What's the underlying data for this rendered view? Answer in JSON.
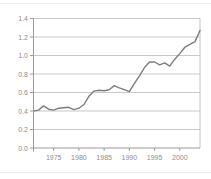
{
  "page": {
    "background": "#ffffff",
    "top_rule_color": "#efefef",
    "bottom_rule_color": "#e9e9e6"
  },
  "chart_data": {
    "type": "line",
    "title": "",
    "xlabel": "",
    "ylabel": "",
    "legend": "none",
    "grid": true,
    "x": [
      1971,
      1972,
      1973,
      1974,
      1975,
      1976,
      1977,
      1978,
      1979,
      1980,
      1981,
      1982,
      1983,
      1984,
      1985,
      1986,
      1987,
      1988,
      1989,
      1990,
      1991,
      1992,
      1993,
      1994,
      1995,
      1996,
      1997,
      1998,
      1999,
      2000,
      2001,
      2002,
      2003,
      2004
    ],
    "values": [
      0.4,
      0.41,
      0.455,
      0.42,
      0.41,
      0.43,
      0.435,
      0.44,
      0.415,
      0.43,
      0.47,
      0.56,
      0.615,
      0.625,
      0.62,
      0.63,
      0.675,
      0.65,
      0.63,
      0.61,
      0.7,
      0.78,
      0.87,
      0.93,
      0.93,
      0.9,
      0.92,
      0.885,
      0.96,
      1.02,
      1.09,
      1.12,
      1.15,
      1.27
    ],
    "xlim": [
      1971,
      2004
    ],
    "ylim": [
      0,
      1.4
    ],
    "x_ticks": [
      "1975",
      "1980",
      "1985",
      "1990",
      "1995",
      "2000"
    ],
    "y_ticks": [
      "0.0",
      "0.2",
      "0.4",
      "0.6",
      "0.8",
      "1.0",
      "1.2",
      "1.4"
    ],
    "colors": {
      "series_line": "#7d7d7d",
      "gridline": "#c9c9c9",
      "axis": "#9a9a9a",
      "plot_border": "#c4c4c4",
      "tick_label": "#8d8d8d"
    }
  }
}
